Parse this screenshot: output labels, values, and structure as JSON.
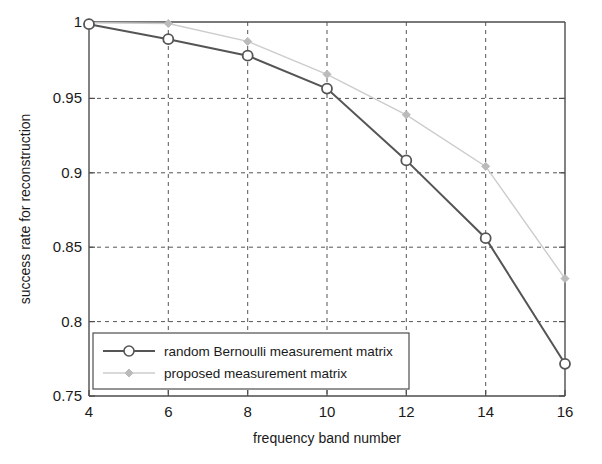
{
  "chart_data": {
    "type": "line",
    "title": "",
    "xlabel": "frequency band number",
    "ylabel": "success rate for reconstruction",
    "x": [
      4,
      6,
      8,
      10,
      12,
      14,
      16
    ],
    "xlim": [
      4,
      16
    ],
    "ylim": [
      0.75,
      1.0
    ],
    "xticks": [
      "4",
      "6",
      "8",
      "10",
      "12",
      "14",
      "16"
    ],
    "yticks": [
      "0.75",
      "0.8",
      "0.85",
      "0.9",
      "0.95",
      "1"
    ],
    "ytick_values": [
      0.75,
      0.8,
      0.85,
      0.9,
      0.95,
      1.0
    ],
    "grid": true,
    "grid_style": "dashed",
    "legend_position": "lower left",
    "series": [
      {
        "name": "random Bernoulli measurement matrix",
        "values": [
          0.9985,
          0.9885,
          0.9775,
          0.9555,
          0.9075,
          0.8555,
          0.7715
        ],
        "color": "#555555",
        "marker": "circle",
        "linewidth": 2.0
      },
      {
        "name": "proposed measurement matrix",
        "values": [
          0.9995,
          0.999,
          0.987,
          0.965,
          0.938,
          0.9035,
          0.8285
        ],
        "color": "#cccccc",
        "marker": "diamond",
        "linewidth": 1.4
      }
    ]
  },
  "legend": {
    "entries": [
      "random Bernoulli measurement matrix",
      "proposed measurement matrix"
    ]
  },
  "colors": {
    "axis": "#4d4d4d",
    "grid": "#555555",
    "series_dark": "#555555",
    "series_light": "#cccccc",
    "background": "#ffffff",
    "text": "#1a1a1a"
  }
}
